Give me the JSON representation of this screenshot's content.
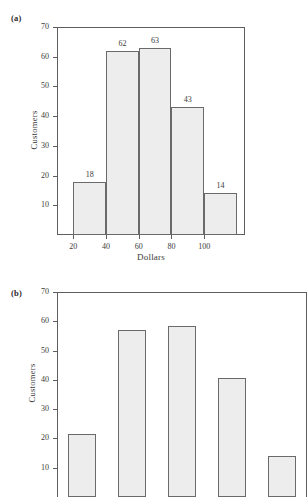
{
  "figure": {
    "panels": [
      {
        "letter": "(a)",
        "ylabel": "Customers",
        "xlabel": "Dollars"
      },
      {
        "letter": "(b)",
        "ylabel": "Customers",
        "xlabel": ""
      }
    ]
  },
  "chart_data": [
    {
      "type": "bar",
      "title": "",
      "panel": "(a)",
      "xlabel": "Dollars",
      "ylabel": "Customers",
      "categories": [
        "20-40",
        "40-60",
        "60-80",
        "80-100",
        "100-120"
      ],
      "values": [
        18,
        62,
        63,
        43,
        14
      ],
      "data_labels": [
        "18",
        "62",
        "63",
        "43",
        "14"
      ],
      "bin_edges": [
        20,
        40,
        60,
        80,
        100,
        120
      ],
      "xtick_labels": [
        "20",
        "40",
        "60",
        "80",
        "100"
      ],
      "xtick_values": [
        20,
        40,
        60,
        80,
        100
      ],
      "ytick_labels": [
        "10",
        "20",
        "30",
        "40",
        "50",
        "60",
        "70"
      ],
      "ytick_values": [
        10,
        20,
        30,
        40,
        50,
        60,
        70
      ],
      "ylim": [
        0,
        70
      ],
      "xlim": [
        10,
        125
      ],
      "grid": false,
      "legend": false,
      "bar_gap": 0,
      "bar_fill": "#ededed",
      "bar_edge": "#6a6a6a"
    },
    {
      "type": "bar",
      "title": "",
      "panel": "(b)",
      "xlabel": "",
      "ylabel": "Customers",
      "categories": [
        "1",
        "2",
        "3",
        "4",
        "5"
      ],
      "values": [
        21.5,
        57,
        58.5,
        40.5,
        14
      ],
      "data_labels": [
        "",
        "",
        "",
        "",
        ""
      ],
      "xtick_labels": [],
      "ytick_labels": [
        "10",
        "20",
        "30",
        "40",
        "50",
        "60",
        "70"
      ],
      "ytick_values": [
        10,
        20,
        30,
        40,
        50,
        60,
        70
      ],
      "ylim": [
        0,
        70
      ],
      "grid": false,
      "legend": false,
      "bar_gap": 22,
      "bar_fill": "#ededed",
      "bar_edge": "#6a6a6a",
      "note": "panel is clipped by the bottom edge of the screenshot"
    }
  ]
}
